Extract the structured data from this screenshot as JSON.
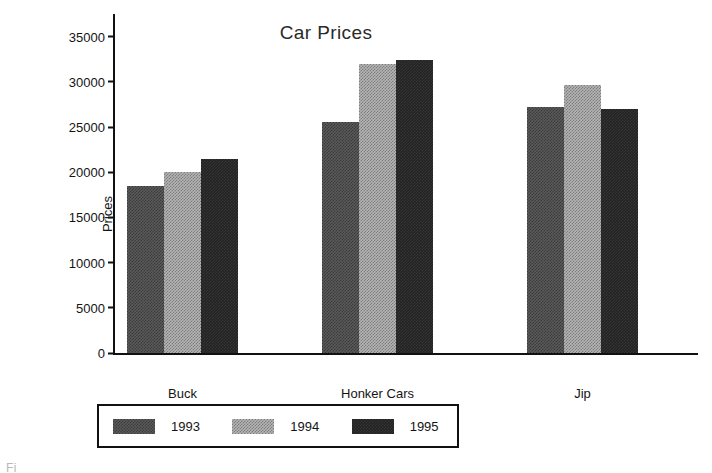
{
  "chart_data": {
    "type": "bar",
    "title": "Car Prices",
    "xlabel": "",
    "ylabel": "Prices",
    "categories": [
      "Buck",
      "Honker Cars",
      "Jip"
    ],
    "series": [
      {
        "name": "1993",
        "color": "#5a5a5a",
        "values": [
          18500,
          25600,
          27200
        ]
      },
      {
        "name": "1994",
        "color": "#b4b4b4",
        "values": [
          20000,
          32000,
          29600
        ]
      },
      {
        "name": "1995",
        "color": "#232323",
        "values": [
          21500,
          32400,
          27000
        ]
      }
    ],
    "ylim": [
      0,
      37500
    ],
    "yticks": [
      0,
      5000,
      10000,
      15000,
      20000,
      25000,
      30000,
      35000
    ],
    "ytick_labels": [
      "0",
      "5000",
      "10000",
      "15000",
      "20000",
      "25000",
      "30000",
      "35000"
    ],
    "grid": false,
    "legend_position": "bottom"
  },
  "legend": {
    "items": [
      {
        "label": "1993",
        "swatch": "legend-swatch-1993"
      },
      {
        "label": "1994",
        "swatch": "legend-swatch-1994"
      },
      {
        "label": "1995",
        "swatch": "legend-swatch-1995"
      }
    ]
  },
  "artifacts": {
    "bottom_caption": "Fi"
  }
}
